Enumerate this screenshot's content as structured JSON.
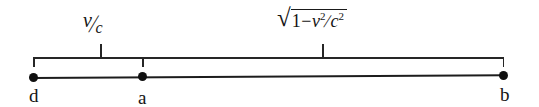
{
  "figure": {
    "type": "relativity-number-line-diagram",
    "background_color": "#ffffff",
    "ink_color": "#1a1a1a"
  },
  "annotations": {
    "velocity_ratio": {
      "numerator": "v",
      "solidus": "/",
      "denominator": "c",
      "plain": "v/c"
    },
    "lorentz_factor": {
      "radical": "√",
      "one": "1",
      "minus": "−",
      "v_symbol": "v",
      "v_exponent": "2",
      "solidus": "/",
      "c_symbol": "c",
      "c_exponent": "2",
      "plain": "√(1−v²/c²)"
    }
  },
  "points": [
    {
      "id": "d",
      "label": "d"
    },
    {
      "id": "a",
      "label": "a"
    },
    {
      "id": "b",
      "label": "b"
    }
  ]
}
